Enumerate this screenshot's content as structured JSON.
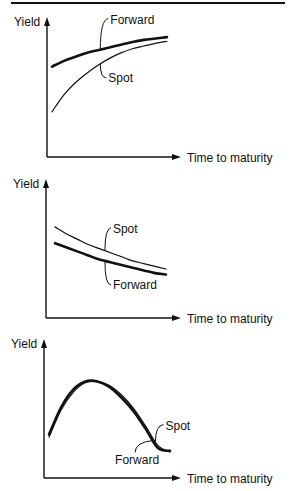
{
  "chart_data": [
    {
      "type": "line",
      "title": "",
      "xlabel": "Time to maturity",
      "ylabel": "Yield",
      "grid": false,
      "x": [
        0,
        0.1,
        0.2,
        0.3,
        0.4,
        0.5,
        0.6,
        0.7,
        0.8,
        0.9,
        1.0
      ],
      "ylim": [
        0,
        1
      ],
      "xlim": [
        0,
        1.2
      ],
      "series": [
        {
          "name": "Forward",
          "values": [
            0.66,
            0.7,
            0.73,
            0.76,
            0.78,
            0.8,
            0.82,
            0.84,
            0.855,
            0.865,
            0.875
          ],
          "weight": "heavy"
        },
        {
          "name": "Spot",
          "values": [
            0.33,
            0.45,
            0.54,
            0.61,
            0.67,
            0.72,
            0.76,
            0.79,
            0.81,
            0.83,
            0.845
          ],
          "weight": "light"
        }
      ]
    },
    {
      "type": "line",
      "title": "",
      "xlabel": "Time to maturity",
      "ylabel": "Yield",
      "grid": false,
      "x": [
        0,
        0.1,
        0.2,
        0.3,
        0.4,
        0.5,
        0.6,
        0.7,
        0.8,
        0.9,
        1.0
      ],
      "ylim": [
        0,
        1
      ],
      "xlim": [
        0,
        1.2
      ],
      "series": [
        {
          "name": "Spot",
          "values": [
            0.67,
            0.62,
            0.58,
            0.54,
            0.51,
            0.48,
            0.45,
            0.42,
            0.4,
            0.38,
            0.36
          ],
          "weight": "light"
        },
        {
          "name": "Forward",
          "values": [
            0.55,
            0.52,
            0.49,
            0.46,
            0.43,
            0.41,
            0.39,
            0.37,
            0.35,
            0.33,
            0.32
          ],
          "weight": "heavy"
        }
      ]
    },
    {
      "type": "line",
      "title": "",
      "xlabel": "Time to maturity",
      "ylabel": "Yield",
      "grid": false,
      "x": [
        0,
        0.1,
        0.2,
        0.3,
        0.4,
        0.5,
        0.6,
        0.7,
        0.8,
        0.9,
        1.0
      ],
      "ylim": [
        0,
        1
      ],
      "xlim": [
        0,
        1.2
      ],
      "series": [
        {
          "name": "Spot",
          "values": [
            0.3,
            0.5,
            0.63,
            0.7,
            0.71,
            0.68,
            0.61,
            0.51,
            0.38,
            0.24,
            0.19
          ],
          "weight": "light"
        },
        {
          "name": "Forward",
          "values": [
            0.32,
            0.52,
            0.65,
            0.71,
            0.71,
            0.67,
            0.59,
            0.49,
            0.36,
            0.22,
            0.2
          ],
          "weight": "heavy"
        }
      ]
    }
  ]
}
